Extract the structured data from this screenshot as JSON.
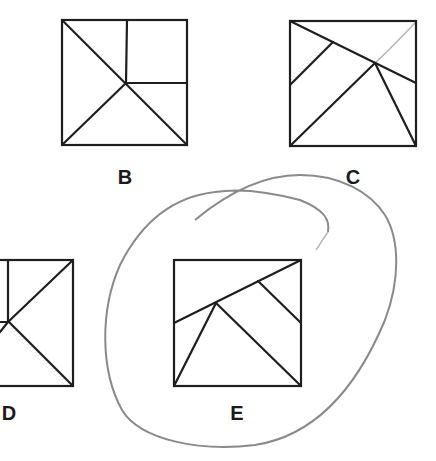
{
  "figure": {
    "panels": [
      {
        "label": "B",
        "pieces": 5,
        "circled": false
      },
      {
        "label": "C",
        "pieces": 5,
        "circled": false
      },
      {
        "label": "D",
        "pieces": 5,
        "circled": false,
        "partially_visible": true
      },
      {
        "label": "E",
        "pieces": 5,
        "circled": true
      }
    ],
    "annotation": {
      "type": "hand-drawn loop",
      "encloses": "E",
      "color": "#8a8a8a"
    }
  }
}
